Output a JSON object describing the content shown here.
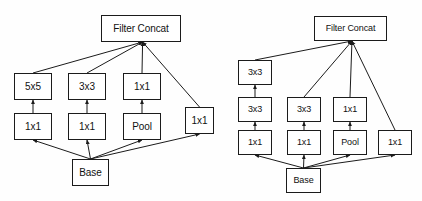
{
  "figure": {
    "background_color": "#fefefe",
    "stroke_color": "#1b1b1b",
    "text_color": "#111111"
  },
  "diagrams": [
    {
      "id": "left",
      "name": "inception-module-5x5",
      "nodes": [
        {
          "id": "l-concat",
          "label": "Filter Concat",
          "x": 101,
          "y": 15,
          "w": 80,
          "h": 27,
          "font": 10
        },
        {
          "id": "l-5x5",
          "label": "5x5",
          "x": 14,
          "y": 73,
          "w": 38,
          "h": 27,
          "font": 10
        },
        {
          "id": "l-3x3",
          "label": "3x3",
          "x": 68,
          "y": 73,
          "w": 38,
          "h": 27,
          "font": 10
        },
        {
          "id": "l-1x1-t",
          "label": "1x1",
          "x": 123,
          "y": 73,
          "w": 38,
          "h": 27,
          "font": 10
        },
        {
          "id": "l-1x1-a",
          "label": "1x1",
          "x": 14,
          "y": 113,
          "w": 38,
          "h": 27,
          "font": 10
        },
        {
          "id": "l-1x1-b",
          "label": "1x1",
          "x": 68,
          "y": 113,
          "w": 38,
          "h": 27,
          "font": 10
        },
        {
          "id": "l-pool",
          "label": "Pool",
          "x": 123,
          "y": 113,
          "w": 38,
          "h": 27,
          "font": 10
        },
        {
          "id": "l-1x1-r",
          "label": "1x1",
          "x": 185,
          "y": 107,
          "w": 29,
          "h": 27,
          "font": 10
        },
        {
          "id": "l-base",
          "label": "Base",
          "x": 72,
          "y": 159,
          "w": 37,
          "h": 27,
          "font": 10
        }
      ],
      "edges": [
        {
          "from": "l-base",
          "to": "l-1x1-a"
        },
        {
          "from": "l-base",
          "to": "l-1x1-b"
        },
        {
          "from": "l-base",
          "to": "l-pool"
        },
        {
          "from": "l-base",
          "to": "l-1x1-r"
        },
        {
          "from": "l-1x1-a",
          "to": "l-5x5"
        },
        {
          "from": "l-1x1-b",
          "to": "l-3x3"
        },
        {
          "from": "l-pool",
          "to": "l-1x1-t"
        },
        {
          "from": "l-5x5",
          "to": "l-concat"
        },
        {
          "from": "l-3x3",
          "to": "l-concat"
        },
        {
          "from": "l-1x1-t",
          "to": "l-concat"
        },
        {
          "from": "l-1x1-r",
          "to": "l-concat"
        }
      ]
    },
    {
      "id": "right",
      "name": "inception-module-factorized-3x3",
      "nodes": [
        {
          "id": "r-concat",
          "label": "Filter Concat",
          "x": 314,
          "y": 16,
          "w": 73,
          "h": 25,
          "font": 9
        },
        {
          "id": "r-3x3-t",
          "label": "3x3",
          "x": 238,
          "y": 60,
          "w": 34,
          "h": 25,
          "font": 9
        },
        {
          "id": "r-3x3-m",
          "label": "3x3",
          "x": 238,
          "y": 97,
          "w": 34,
          "h": 25,
          "font": 9
        },
        {
          "id": "r-1x1-l",
          "label": "1x1",
          "x": 238,
          "y": 130,
          "w": 34,
          "h": 25,
          "font": 9
        },
        {
          "id": "r-3x3-c",
          "label": "3x3",
          "x": 287,
          "y": 97,
          "w": 34,
          "h": 25,
          "font": 9
        },
        {
          "id": "r-1x1-c",
          "label": "1x1",
          "x": 287,
          "y": 130,
          "w": 34,
          "h": 25,
          "font": 9
        },
        {
          "id": "r-1x1-p",
          "label": "1x1",
          "x": 333,
          "y": 97,
          "w": 34,
          "h": 25,
          "font": 9
        },
        {
          "id": "r-pool",
          "label": "Pool",
          "x": 333,
          "y": 130,
          "w": 34,
          "h": 25,
          "font": 9
        },
        {
          "id": "r-1x1-r",
          "label": "1x1",
          "x": 378,
          "y": 130,
          "w": 34,
          "h": 25,
          "font": 9
        },
        {
          "id": "r-base",
          "label": "Base",
          "x": 286,
          "y": 168,
          "w": 35,
          "h": 25,
          "font": 9
        }
      ],
      "edges": [
        {
          "from": "r-base",
          "to": "r-1x1-l"
        },
        {
          "from": "r-base",
          "to": "r-1x1-c"
        },
        {
          "from": "r-base",
          "to": "r-pool"
        },
        {
          "from": "r-base",
          "to": "r-1x1-r"
        },
        {
          "from": "r-1x1-l",
          "to": "r-3x3-m"
        },
        {
          "from": "r-3x3-m",
          "to": "r-3x3-t"
        },
        {
          "from": "r-1x1-c",
          "to": "r-3x3-c"
        },
        {
          "from": "r-pool",
          "to": "r-1x1-p"
        },
        {
          "from": "r-3x3-t",
          "to": "r-concat"
        },
        {
          "from": "r-3x3-c",
          "to": "r-concat"
        },
        {
          "from": "r-1x1-p",
          "to": "r-concat"
        },
        {
          "from": "r-1x1-r",
          "to": "r-concat"
        }
      ]
    }
  ]
}
